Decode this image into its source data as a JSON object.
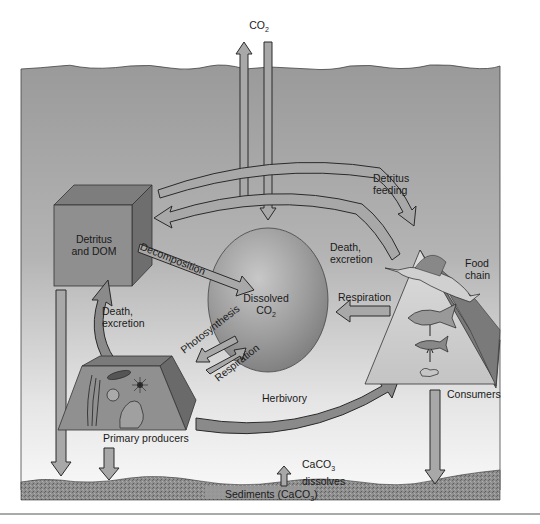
{
  "atmosphere": {
    "co2_label": "CO",
    "co2_sub": "2"
  },
  "reservoirs": {
    "detritus": {
      "line1": "Detritus",
      "line2": "and DOM"
    },
    "dissolved_co2": {
      "line1": "Dissolved",
      "line2": "CO",
      "line2_sub": "2"
    },
    "primary_producers": {
      "label": "Primary producers"
    },
    "food_chain": {
      "line1": "Food",
      "line2": "chain"
    },
    "consumers": {
      "label": "Consumers"
    },
    "sediments": {
      "label_prefix": "Sediments (CaCO",
      "label_sub": "3",
      "label_suffix": ")"
    }
  },
  "processes": {
    "detritus_feeding": {
      "line1": "Detritus",
      "line2": "feeding"
    },
    "death_excretion_consumers": {
      "line1": "Death,",
      "line2": "excretion"
    },
    "decomposition": {
      "label": "Decomposition"
    },
    "death_excretion_producers": {
      "line1": "Death,",
      "line2": "excretion"
    },
    "photosynthesis": {
      "label": "Photosynthesis"
    },
    "respiration_producers": {
      "label": "Respiration"
    },
    "respiration_consumers": {
      "label": "Respiration"
    },
    "herbivory": {
      "label": "Herbivory"
    },
    "caco3_dissolves": {
      "line1_prefix": "CaCO",
      "line1_sub": "3",
      "line2": "dissolves"
    }
  },
  "colors": {
    "water_top": "#9a9a9a",
    "water_bottom": "#f4f4f4",
    "arrow_fill": "#a8a8a8",
    "arrow_stroke": "#2a2a2a",
    "sediment": "#8c8c8c",
    "sphere": "#9e9e9e",
    "box_front": "#8f8f8f",
    "box_top": "#7d7d7d",
    "box_side": "#6e6e6e",
    "pyramid_side": "#7a7a7a"
  }
}
